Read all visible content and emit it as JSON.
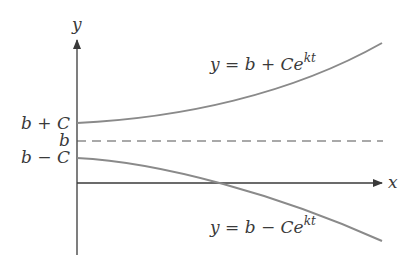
{
  "diagram": {
    "axes": {
      "x_label": "x",
      "y_label": "y"
    },
    "tick_labels": {
      "upper": "b + C",
      "middle": "b",
      "lower": "b − C"
    },
    "curves": {
      "upper": {
        "label_prefix": "y = b + Ce",
        "label_exp": "kt"
      },
      "lower": {
        "label_prefix": "y = b − Ce",
        "label_exp": "kt"
      }
    },
    "asymptote": {
      "style": "dashed",
      "level": "b"
    },
    "colors": {
      "axis": "#3a3a3a",
      "curve": "#8a8a8a",
      "dash": "#555555",
      "text": "#3a3a3a"
    }
  }
}
